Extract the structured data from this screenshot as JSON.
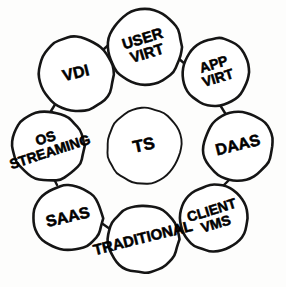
{
  "diagram": {
    "style": "hand-drawn black ink on white",
    "colors": {
      "background": "#fdfdfc",
      "ink": "#151515",
      "circle_fill": "#ffffff",
      "text": "#000000"
    },
    "center_node": {
      "id": "ts",
      "label": "TS",
      "lines": [
        "TS"
      ],
      "cx": 144,
      "cy": 146,
      "r": 38,
      "rotation": -12,
      "font_size": 17
    },
    "ring_nodes": [
      {
        "id": "user-virt",
        "label": "USER VIRT",
        "lines": [
          "USER",
          "VIRT"
        ],
        "cx": 145,
        "cy": 47,
        "r": 38,
        "rotation": -17,
        "font_size": 15
      },
      {
        "id": "app-virt",
        "label": "APP VIRT",
        "lines": [
          "APP",
          "VIRT"
        ],
        "cx": 216,
        "cy": 72,
        "r": 34,
        "rotation": -17,
        "font_size": 14
      },
      {
        "id": "daas",
        "label": "DAAS",
        "lines": [
          "DAAS"
        ],
        "cx": 238,
        "cy": 146,
        "r": 35,
        "rotation": -14,
        "font_size": 16
      },
      {
        "id": "client-vms",
        "label": "CLIENT VMS",
        "lines": [
          "CLIENT",
          "VMS"
        ],
        "cx": 214,
        "cy": 218,
        "r": 34,
        "rotation": -17,
        "font_size": 14
      },
      {
        "id": "traditional",
        "label": "TRADITIONAL",
        "lines": [
          "TRADITIONAL"
        ],
        "cx": 143,
        "cy": 239,
        "r": 35,
        "rotation": -14,
        "font_size": 15
      },
      {
        "id": "saas",
        "label": "SAAS",
        "lines": [
          "SAAS"
        ],
        "cx": 68,
        "cy": 218,
        "r": 34,
        "rotation": -13,
        "font_size": 16
      },
      {
        "id": "os-streaming",
        "label": "OS STREAMING",
        "lines": [
          "OS",
          "STREAMING"
        ],
        "cx": 48,
        "cy": 146,
        "r": 36,
        "rotation": -18,
        "font_size": 14
      },
      {
        "id": "vdi",
        "label": "VDI",
        "lines": [
          "VDI"
        ],
        "cx": 76,
        "cy": 74,
        "r": 38,
        "rotation": -14,
        "font_size": 16
      }
    ],
    "connectors": [
      {
        "id": "vdi-to-user-virt",
        "from": "vdi",
        "to": "user-virt",
        "x1": 104,
        "y1": 49,
        "x2": 114,
        "y2": 40
      },
      {
        "id": "user-virt-to-app-virt",
        "from": "user-virt",
        "to": "app-virt",
        "x1": 178,
        "y1": 58,
        "x2": 185,
        "y2": 64
      },
      {
        "id": "app-virt-to-daas",
        "from": "app-virt",
        "to": "daas",
        "x1": 220,
        "y1": 105,
        "x2": 225,
        "y2": 113
      },
      {
        "id": "daas-to-client-vms",
        "from": "daas",
        "to": "client-vms",
        "x1": 229,
        "y1": 180,
        "x2": 222,
        "y2": 187
      },
      {
        "id": "client-vms-to-traditional",
        "from": "client-vms",
        "to": "traditional",
        "x1": 181,
        "y1": 228,
        "x2": 173,
        "y2": 233
      },
      {
        "id": "traditional-to-saas",
        "from": "traditional",
        "to": "saas",
        "x1": 110,
        "y1": 229,
        "x2": 100,
        "y2": 222
      },
      {
        "id": "saas-to-os-streaming",
        "from": "saas",
        "to": "os-streaming",
        "x1": 57,
        "y1": 185,
        "x2": 53,
        "y2": 177
      },
      {
        "id": "os-streaming-to-vdi",
        "from": "os-streaming",
        "to": "vdi",
        "x1": 51,
        "y1": 111,
        "x2": 56,
        "y2": 103
      }
    ]
  },
  "chart_data": {
    "type": "diagram",
    "center": "TS",
    "nodes": [
      "VDI",
      "USER VIRT",
      "APP VIRT",
      "DAAS",
      "CLIENT VMS",
      "TRADITIONAL",
      "SAAS",
      "OS STREAMING",
      "TS"
    ],
    "edges": [
      [
        "VDI",
        "USER VIRT"
      ],
      [
        "USER VIRT",
        "APP VIRT"
      ],
      [
        "APP VIRT",
        "DAAS"
      ],
      [
        "DAAS",
        "CLIENT VMS"
      ],
      [
        "CLIENT VMS",
        "TRADITIONAL"
      ],
      [
        "TRADITIONAL",
        "SAAS"
      ],
      [
        "SAAS",
        "OS STREAMING"
      ],
      [
        "OS STREAMING",
        "VDI"
      ]
    ],
    "layout": "eight nodes arranged in a ring around one isolated center node"
  }
}
